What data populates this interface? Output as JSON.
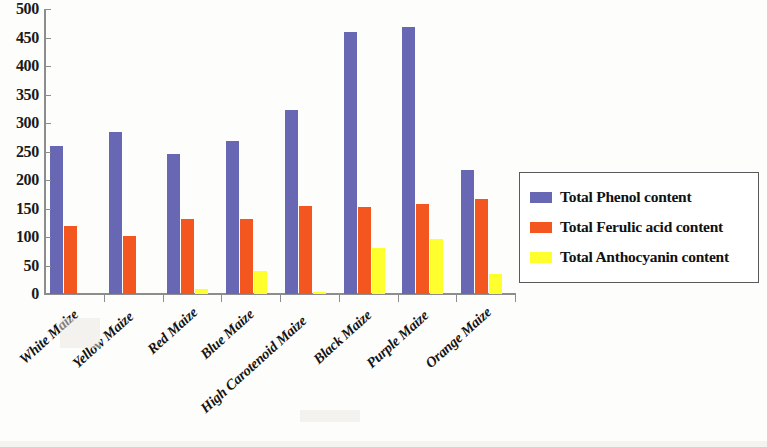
{
  "chart_data": {
    "type": "bar",
    "title": "",
    "xlabel": "",
    "ylabel": "",
    "ylim": [
      0,
      500
    ],
    "ytick_step": 50,
    "yticks": [
      "0",
      "50",
      "100",
      "150",
      "200",
      "250",
      "300",
      "350",
      "400",
      "450",
      "500"
    ],
    "grid": false,
    "legend_position": "right",
    "categories": [
      "White Maize",
      "Yellow Maize",
      "Red Maize",
      "Blue Maize",
      "High Carotenoid Maize",
      "Black Maize",
      "Purple Maize",
      "Orange Maize"
    ],
    "series": [
      {
        "name": "Total Phenol content",
        "color": "#6767b4",
        "values": [
          260,
          285,
          245,
          268,
          322,
          460,
          468,
          218
        ]
      },
      {
        "name": "Total Ferulic acid content",
        "color": "#f4561f",
        "values": [
          120,
          102,
          132,
          132,
          155,
          152,
          158,
          167
        ]
      },
      {
        "name": "Total Anthocyanin content",
        "color": "#ffff2e",
        "values": [
          0,
          0,
          8,
          40,
          3,
          80,
          97,
          35
        ]
      }
    ]
  },
  "legend": {
    "items": [
      {
        "label": "Total Phenol content",
        "swatch": "phenol"
      },
      {
        "label": "Total Ferulic acid content",
        "swatch": "ferulic"
      },
      {
        "label": "Total Anthocyanin content",
        "swatch": "anthocyanin"
      }
    ]
  }
}
